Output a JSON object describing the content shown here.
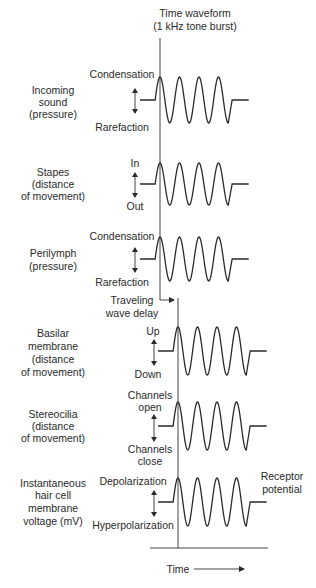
{
  "title": {
    "line1": "Time waveform",
    "line2": "(1 kHz tone burst)"
  },
  "rows": [
    {
      "name": "incoming-sound",
      "label": [
        "Incoming",
        "sound",
        "(pressure)"
      ],
      "top_label": "Condensation",
      "bottom_label": "Rarefaction"
    },
    {
      "name": "stapes",
      "label": [
        "Stapes",
        "(distance",
        "of movement)"
      ],
      "top_label": "In",
      "bottom_label": "Out"
    },
    {
      "name": "perilymph",
      "label": [
        "Perilymph",
        "(pressure)"
      ],
      "top_label": "Condensation",
      "bottom_label": "Rarefaction"
    },
    {
      "name": "basilar-membrane",
      "label": [
        "Basilar",
        "membrane",
        "(distance",
        "of movement)"
      ],
      "top_label": "Up",
      "bottom_label": "Down"
    },
    {
      "name": "stereocilia",
      "label": [
        "Stereocilia",
        "(distance",
        "of movement)"
      ],
      "top_label": [
        "Channels",
        "open"
      ],
      "bottom_label": [
        "Channels",
        "close"
      ]
    },
    {
      "name": "hair-cell-voltage",
      "label": [
        "Instantaneous",
        "hair cell",
        "membrane",
        "voltage (mV)"
      ],
      "top_label": "Depolarization",
      "bottom_label": "Hyperpolarization",
      "right_label": [
        "Receptor",
        "potential"
      ]
    }
  ],
  "delay_label": [
    "Traveling",
    "wave delay"
  ],
  "x_axis_label": "Time",
  "colors": {
    "ink": "#2a2a2a",
    "background": "#ffffff"
  }
}
